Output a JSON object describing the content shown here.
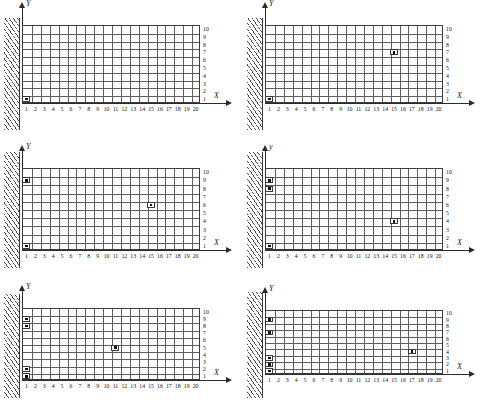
{
  "figure": {
    "type": "mesh-diagram-grid",
    "panel_count": 6,
    "axis_x_label": "X",
    "axis_y_label": "Y",
    "origin_label": "o",
    "x_ticks": [
      "1",
      "2",
      "3",
      "4",
      "5",
      "6",
      "7",
      "8",
      "9",
      "10",
      "11",
      "12",
      "13",
      "14",
      "15",
      "16",
      "17",
      "18",
      "19",
      "20"
    ],
    "y_ticks": [
      "1",
      "2",
      "3",
      "4",
      "5",
      "6",
      "7",
      "8",
      "9",
      "10"
    ],
    "colors": {
      "grid": "#5e5e5e",
      "border": "#3c3c3c",
      "axis": "#2b2b2b",
      "wall": "#4a4a4a",
      "marker": "#111111",
      "background": "#ffffff"
    }
  },
  "panels": [
    {
      "id": "panel-1",
      "label": "a",
      "axis_x_label": "X",
      "axis_y_label": "Y",
      "origin_label": "o",
      "markers": [
        {
          "x": 1,
          "y": 1
        }
      ]
    },
    {
      "id": "panel-2",
      "label": "b",
      "axis_x_label": "X",
      "axis_y_label": "Y",
      "origin_label": "o",
      "markers": [
        {
          "x": 15,
          "y": 7
        },
        {
          "x": 1,
          "y": 1
        }
      ]
    },
    {
      "id": "panel-3",
      "label": "c",
      "axis_x_label": "X",
      "axis_y_label": "Y",
      "origin_label": "o",
      "markers": [
        {
          "x": 1,
          "y": 9
        },
        {
          "x": 15,
          "y": 6
        },
        {
          "x": 1,
          "y": 1
        }
      ]
    },
    {
      "id": "panel-4",
      "label": "d",
      "axis_x_label": "X",
      "axis_y_label": "y",
      "origin_label": "o",
      "markers": [
        {
          "x": 1,
          "y": 9
        },
        {
          "x": 1,
          "y": 8
        },
        {
          "x": 15,
          "y": 4
        },
        {
          "x": 1,
          "y": 1
        }
      ]
    },
    {
      "id": "panel-5",
      "label": "e",
      "axis_x_label": "X",
      "axis_y_label": "Y",
      "origin_label": "o",
      "markers": [
        {
          "x": 1,
          "y": 9
        },
        {
          "x": 1,
          "y": 8
        },
        {
          "x": 11,
          "y": 5
        },
        {
          "x": 1,
          "y": 2
        },
        {
          "x": 1,
          "y": 1
        }
      ]
    },
    {
      "id": "panel-6",
      "label": "f",
      "axis_x_label": "X",
      "axis_y_label": "Y",
      "origin_label": "o",
      "markers": [
        {
          "x": 1,
          "y": 9
        },
        {
          "x": 1,
          "y": 7
        },
        {
          "x": 17,
          "y": 4
        },
        {
          "x": 1,
          "y": 3
        },
        {
          "x": 1,
          "y": 2
        },
        {
          "x": 1,
          "y": 1
        }
      ]
    }
  ],
  "chart_data": {
    "type": "scatter",
    "title": "",
    "xlabel": "X",
    "ylabel": "Y",
    "xlim": [
      0,
      20
    ],
    "ylim": [
      0,
      10
    ],
    "grid": true,
    "legend": "none",
    "categories": [
      "panel-1",
      "panel-2",
      "panel-3",
      "panel-4",
      "panel-5",
      "panel-6"
    ],
    "series": [
      {
        "name": "panel-1",
        "points": [
          [
            1,
            1
          ]
        ]
      },
      {
        "name": "panel-2",
        "points": [
          [
            15,
            7
          ],
          [
            1,
            1
          ]
        ]
      },
      {
        "name": "panel-3",
        "points": [
          [
            1,
            9
          ],
          [
            15,
            6
          ],
          [
            1,
            1
          ]
        ]
      },
      {
        "name": "panel-4",
        "points": [
          [
            1,
            9
          ],
          [
            1,
            8
          ],
          [
            15,
            4
          ],
          [
            1,
            1
          ]
        ]
      },
      {
        "name": "panel-5",
        "points": [
          [
            1,
            9
          ],
          [
            1,
            8
          ],
          [
            11,
            5
          ],
          [
            1,
            2
          ],
          [
            1,
            1
          ]
        ]
      },
      {
        "name": "panel-6",
        "points": [
          [
            1,
            9
          ],
          [
            1,
            7
          ],
          [
            17,
            4
          ],
          [
            1,
            3
          ],
          [
            1,
            2
          ],
          [
            1,
            1
          ]
        ]
      }
    ]
  }
}
